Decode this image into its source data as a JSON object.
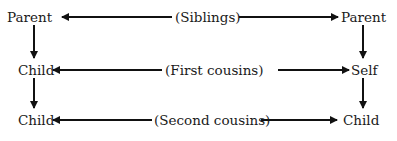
{
  "diagram": {
    "row1": {
      "left": "Parent",
      "middle": "(Siblings)",
      "right": "Parent"
    },
    "row2": {
      "left": "Child",
      "middle": "(First cousins)",
      "right": "Self"
    },
    "row3": {
      "left": "Child",
      "middle": "(Second cousins)",
      "right": "Child"
    }
  }
}
